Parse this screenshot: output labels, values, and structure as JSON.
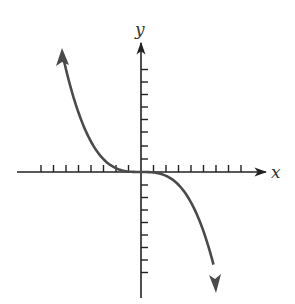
{
  "chart_data": {
    "type": "line",
    "title": "",
    "xlabel": "x",
    "ylabel": "y",
    "function": "y = -k x^3 (odd cubic, decreasing)",
    "x_ticks_each_side": 8,
    "y_ticks_each_side": 8,
    "tick_labels": "none",
    "grid": false,
    "legend": "none",
    "xlim": [
      -10,
      10
    ],
    "ylim": [
      -10,
      10
    ],
    "series": [
      {
        "name": "curve",
        "x": [
          -6.3,
          -6,
          -5,
          -4,
          -3,
          -2,
          -1,
          0,
          1,
          2,
          3,
          4,
          5,
          5.8
        ],
        "y": [
          9.6,
          8.3,
          4.8,
          2.5,
          1.1,
          0.3,
          0.04,
          0,
          -0.04,
          -0.3,
          -1.1,
          -2.5,
          -4.8,
          -9.6
        ],
        "arrows": "both ends"
      }
    ],
    "colors": {
      "axis": "#222222",
      "curve": "#4a4a4a",
      "label": "#333333"
    }
  },
  "labels": {
    "x_axis": "x",
    "y_axis": "y"
  }
}
